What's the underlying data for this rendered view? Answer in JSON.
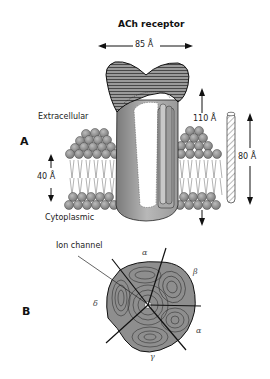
{
  "figure": {
    "title": "ACh receptor",
    "panel_a": {
      "label": "A",
      "regions": {
        "extracellular": "Extracellular",
        "cytoplasmic": "Cytoplasmic"
      },
      "dimensions": {
        "width": "85 Å",
        "total_length": "110 Å",
        "rod_length": "80 Å",
        "membrane_thickness": "40 Å"
      }
    },
    "panel_b": {
      "label": "B",
      "callout": "Ion channel",
      "subunits": [
        "α",
        "β",
        "α",
        "γ",
        "δ"
      ]
    },
    "colors": {
      "ink": "#1a1a1a",
      "protein_fill": "#8c8c8c",
      "protein_light": "#c4c4c4",
      "lipid_head": "#9a9a9a",
      "background": "#ffffff"
    }
  }
}
